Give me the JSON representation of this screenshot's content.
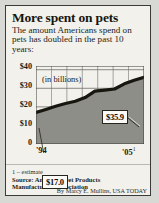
{
  "card": {
    "title": "More spent on pets",
    "subtitle": "The amount Americans spend on pets has doubled in the past 10 years:",
    "footnote": "1 – estimate",
    "source": "Source: American Pet Products Manufacturers Association",
    "byline": "By Marcy E. Mullins, USA TODAY"
  },
  "chart_data": {
    "type": "area",
    "title": "More spent on pets",
    "subtitle": "The amount Americans spend on pets has doubled in the past 10 years:",
    "xlabel": "",
    "ylabel": "(in billions)",
    "axis_note": "(in billions)",
    "categories": [
      "'94",
      "'95",
      "'96",
      "'97",
      "'98",
      "'99",
      "'00",
      "'01",
      "'02",
      "'03",
      "'04",
      "'05"
    ],
    "x_tick_labels": [
      "'94",
      "'05"
    ],
    "x_tick_end_superscript": "1",
    "values": [
      17.0,
      18.6,
      20.3,
      21.8,
      23.0,
      25.0,
      28.5,
      29.0,
      29.6,
      32.4,
      34.3,
      35.9
    ],
    "ylim": [
      0,
      42
    ],
    "y_ticks": [
      0,
      10,
      20,
      30,
      40
    ],
    "y_tick_labels": [
      "0",
      "$10",
      "$20",
      "$30",
      "$40"
    ],
    "grid": true,
    "vertical_gridlines": 6,
    "legend": null,
    "annotations": [
      {
        "name": "start-value",
        "label": "$17.0",
        "x": "'94",
        "y": 17.0
      },
      {
        "name": "end-value",
        "label": "$35.9",
        "x": "'05",
        "y": 35.9
      }
    ],
    "colors": {
      "area_fill": "#8e8e88",
      "line": "#17170f",
      "grid": "#6f6f69",
      "background": "#f2f1ec",
      "callout_bg": "#fbfaf6",
      "border": "#3a3a38"
    }
  }
}
